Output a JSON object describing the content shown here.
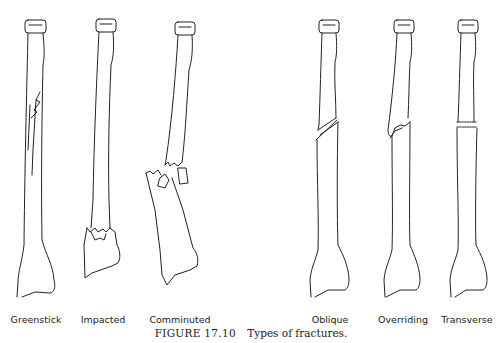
{
  "figure": {
    "number": "FIGURE 17.10",
    "title": "Types of fractures."
  },
  "bones": [
    {
      "id": "greenstick",
      "label": "Greenstick",
      "x": 36
    },
    {
      "id": "impacted",
      "label": "Impacted",
      "x": 103
    },
    {
      "id": "comminuted",
      "label": "Comminuted",
      "x": 180
    },
    {
      "id": "oblique",
      "label": "Oblique",
      "x": 330
    },
    {
      "id": "overriding",
      "label": "Overriding",
      "x": 403
    },
    {
      "id": "transverse",
      "label": "Transverse",
      "x": 467
    }
  ],
  "colors": {
    "line": "#222222",
    "background": "#ffffff"
  }
}
